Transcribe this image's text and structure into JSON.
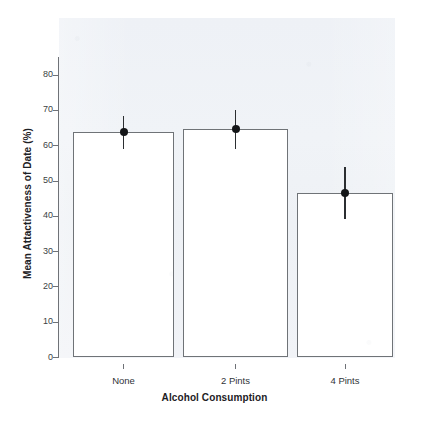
{
  "chart_data": {
    "type": "bar",
    "title": "",
    "subtitle": "",
    "xlabel": "Alcohol Consumption",
    "ylabel": "Mean Attactiveness of Date (%)",
    "categories": [
      "None",
      "2 Pints",
      "4 Pints"
    ],
    "values": [
      64.0,
      64.7,
      46.5
    ],
    "error_bars": {
      "type": "confidence-interval",
      "lower": [
        59.2,
        59.2,
        39.2
      ],
      "upper": [
        68.3,
        70.0,
        53.9
      ]
    },
    "points": [
      64.0,
      64.7,
      46.5
    ],
    "ylim": [
      0,
      85
    ],
    "y_ticks": [
      0,
      10,
      20,
      30,
      40,
      50,
      60,
      70,
      80
    ],
    "y_tick_labels": [
      "0",
      "10",
      "20",
      "30",
      "40",
      "50",
      "60",
      "70",
      "80"
    ],
    "x_tick_labels": [
      "None",
      "2 Pints",
      "4 Pints"
    ],
    "grid": false,
    "legend": "none",
    "series": [
      {
        "name": "Mean Attactiveness of Date (%)",
        "values": [
          64.0,
          64.7,
          46.5
        ]
      }
    ],
    "colors": {
      "bar_fill": "#ffffff",
      "bar_edge": "#6f7377",
      "error_bar": "#2b2e31",
      "point": "#141618",
      "axis": "#6f7277",
      "plot_background": "#eef1f6",
      "text": "#1d2125"
    }
  }
}
